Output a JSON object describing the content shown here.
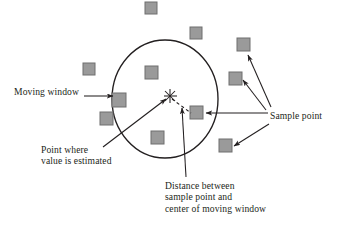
{
  "figure": {
    "type": "diagram",
    "background_color": "#ffffff",
    "line_color": "#231f20",
    "square_fill": "#9a9a9a",
    "square_stroke": "#6e6e6e"
  },
  "labels": {
    "moving_window": "Moving window",
    "sample_point": "Sample point",
    "point_where_line1": "Point where",
    "point_where_line2": "value is estimated",
    "distance_line1": "Distance between",
    "distance_line2": "sample point and",
    "distance_line3": "center of moving window"
  },
  "elements": {
    "moving_window_circle": {
      "center_x": 165,
      "center_y": 99,
      "radius_x": 53,
      "radius_y": 59
    },
    "estimation_point_marker": {
      "x": 170,
      "y": 96,
      "glyph": "asterisk-cross"
    },
    "sample_squares": [
      {
        "x": 151,
        "y": 8,
        "inside_window": false
      },
      {
        "x": 196,
        "y": 33,
        "inside_window": false
      },
      {
        "x": 243,
        "y": 44,
        "inside_window": false
      },
      {
        "x": 89,
        "y": 69,
        "inside_window": false
      },
      {
        "x": 235,
        "y": 78,
        "inside_window": false
      },
      {
        "x": 151,
        "y": 72,
        "inside_window": true
      },
      {
        "x": 119,
        "y": 99,
        "inside_window": true
      },
      {
        "x": 106,
        "y": 118,
        "inside_window": false
      },
      {
        "x": 196,
        "y": 112,
        "inside_window": true
      },
      {
        "x": 157,
        "y": 137,
        "inside_window": true
      },
      {
        "x": 225,
        "y": 145,
        "inside_window": false
      }
    ]
  },
  "connectors": {
    "moving_window_arrow": "Moving window label to circle edge",
    "sample_point_arrows": 4,
    "estimation_point_arrow": "Point where value is estimated to center marker",
    "distance_arrow": "Distance label to dashed distance line",
    "distance_line_style": "dashed"
  }
}
